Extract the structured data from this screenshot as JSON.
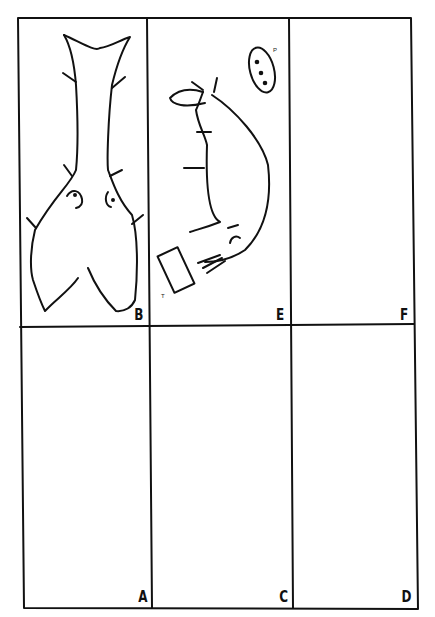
{
  "figure": {
    "layout": "3 columns x 2 rows",
    "stroke_color": "#111111",
    "background": "#ffffff",
    "panels": [
      {
        "id": "B",
        "label": "B",
        "row": 0,
        "col": 0,
        "content": "abstract figure with forked tail shape and two eye-like marks, with short spines"
      },
      {
        "id": "E",
        "label": "E",
        "row": 0,
        "col": 1,
        "content": "curved bent figure with spines, oval with three dots labeled P, rectangle labeled T",
        "sublabels": {
          "p": "P",
          "t": "T"
        }
      },
      {
        "id": "F",
        "label": "F",
        "row": 0,
        "col": 2,
        "content": "oval with crossed mark; small oval with four radiating ticks"
      },
      {
        "id": "A",
        "label": "A",
        "row": 1,
        "col": 0,
        "content": "circle above four-petal flower shape"
      },
      {
        "id": "C",
        "label": "C",
        "row": 1,
        "col": 1,
        "content": "figure with notched top head, two eye marks, narrow stem with spines"
      },
      {
        "id": "D",
        "label": "D",
        "row": 1,
        "col": 2,
        "content": "narrow body figure with notched top, two curled marks, dots, spines, and flared base"
      }
    ]
  }
}
